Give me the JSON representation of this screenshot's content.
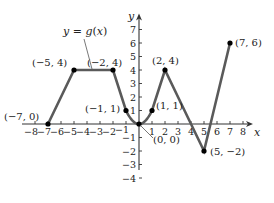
{
  "chart_data": {
    "type": "line",
    "title": "",
    "function_label": "y = g(x)",
    "xlabel": "x",
    "ylabel": "y",
    "xlim": [
      -8,
      8
    ],
    "ylim": [
      -4,
      7
    ],
    "x_ticks": [
      -8,
      -7,
      -6,
      -5,
      -4,
      -3,
      -2,
      -1,
      1,
      2,
      3,
      4,
      5,
      6,
      7,
      8
    ],
    "y_ticks": [
      -4,
      -3,
      -2,
      -1,
      1,
      2,
      3,
      4,
      5,
      6,
      7
    ],
    "grid": false,
    "series": [
      {
        "name": "g(x)",
        "segments": [
          {
            "kind": "line",
            "points": [
              [
                -7,
                0
              ],
              [
                -5,
                4
              ]
            ]
          },
          {
            "kind": "line",
            "points": [
              [
                -5,
                4
              ],
              [
                -2,
                4
              ]
            ]
          },
          {
            "kind": "line",
            "points": [
              [
                -2,
                4
              ],
              [
                -1,
                1
              ]
            ]
          },
          {
            "kind": "parabola",
            "formula": "y = x^2",
            "domain": [
              -1,
              1
            ]
          },
          {
            "kind": "line",
            "points": [
              [
                1,
                1
              ],
              [
                2,
                4
              ]
            ]
          },
          {
            "kind": "line",
            "points": [
              [
                2,
                4
              ],
              [
                5,
                -2
              ]
            ]
          },
          {
            "kind": "line",
            "points": [
              [
                5,
                -2
              ],
              [
                7,
                6
              ]
            ]
          }
        ]
      }
    ],
    "labeled_points": [
      {
        "x": -7,
        "y": 0,
        "label": "(−7, 0)"
      },
      {
        "x": -5,
        "y": 4,
        "label": "(−5, 4)"
      },
      {
        "x": -2,
        "y": 4,
        "label": "(−2, 4)"
      },
      {
        "x": -1,
        "y": 1,
        "label": "(−1, 1)"
      },
      {
        "x": 0,
        "y": 0,
        "label": "(0, 0)"
      },
      {
        "x": 1,
        "y": 1,
        "label": "(1, 1)"
      },
      {
        "x": 2,
        "y": 4,
        "label": "(2, 4)"
      },
      {
        "x": 5,
        "y": -2,
        "label": "(5, −2)"
      },
      {
        "x": 7,
        "y": 6,
        "label": "(7, 6)"
      }
    ]
  },
  "colors": {
    "curve": "#5a5a5a",
    "axis": "#333333",
    "point": "#000000",
    "text": "#222222"
  }
}
